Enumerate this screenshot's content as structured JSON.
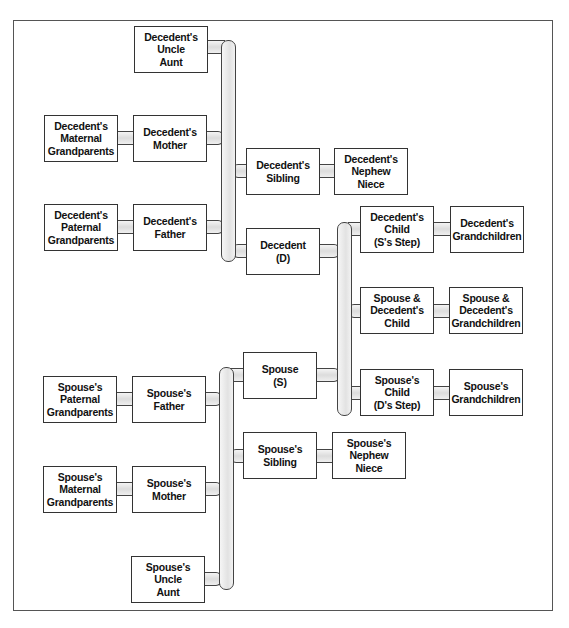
{
  "diagram": {
    "type": "family-tree",
    "colors": {
      "box_border": "#333333",
      "pipe_fill": "#e2e2e2",
      "background": "#ffffff"
    },
    "nodes": {
      "decedent_uncle_aunt": "Decedent's\nUncle\nAunt",
      "decedent_maternal_grandparents": "Decedent's\nMaternal\nGrandparents",
      "decedent_mother": "Decedent's\nMother",
      "decedent_sibling": "Decedent's\nSibling",
      "decedent_nephew_niece": "Decedent's\nNephew\nNiece",
      "decedent_paternal_grandparents": "Decedent's\nPaternal\nGrandparents",
      "decedent_father": "Decedent's\nFather",
      "decedent": "Decedent\n(D)",
      "decedent_child": "Decedent's\nChild\n(S's Step)",
      "decedent_grandchildren": "Decedent's\nGrandchildren",
      "joint_child": "Spouse &\nDecedent's\nChild",
      "joint_grandchildren": "Spouse &\nDecedent's\nGrandchildren",
      "spouse": "Spouse\n(S)",
      "spouse_child": "Spouse's\nChild\n(D's Step)",
      "spouse_grandchildren": "Spouse's\nGrandchildren",
      "spouse_paternal_grandparents": "Spouse's\nPaternal\nGrandparents",
      "spouse_father": "Spouse's\nFather",
      "spouse_sibling": "Spouse's\nSibling",
      "spouse_nephew_niece": "Spouse's\nNephew\nNiece",
      "spouse_maternal_grandparents": "Spouse's\nMaternal\nGrandparents",
      "spouse_mother": "Spouse's\nMother",
      "spouse_uncle_aunt": "Spouse's\nUncle\nAunt"
    },
    "edges": [
      [
        "decedent_maternal_grandparents",
        "decedent_mother"
      ],
      [
        "decedent_paternal_grandparents",
        "decedent_father"
      ],
      [
        "decedent_uncle_aunt",
        "decedent_parents_bus"
      ],
      [
        "decedent_mother",
        "decedent_parents_bus"
      ],
      [
        "decedent_father",
        "decedent_parents_bus"
      ],
      [
        "decedent_parents_bus",
        "decedent_sibling"
      ],
      [
        "decedent_parents_bus",
        "decedent"
      ],
      [
        "decedent_sibling",
        "decedent_nephew_niece"
      ],
      [
        "decedent",
        "children_bus"
      ],
      [
        "spouse",
        "children_bus"
      ],
      [
        "children_bus",
        "decedent_child"
      ],
      [
        "children_bus",
        "joint_child"
      ],
      [
        "children_bus",
        "spouse_child"
      ],
      [
        "decedent_child",
        "decedent_grandchildren"
      ],
      [
        "joint_child",
        "joint_grandchildren"
      ],
      [
        "spouse_child",
        "spouse_grandchildren"
      ],
      [
        "spouse_paternal_grandparents",
        "spouse_father"
      ],
      [
        "spouse_maternal_grandparents",
        "spouse_mother"
      ],
      [
        "spouse_father",
        "spouse_parents_bus"
      ],
      [
        "spouse_mother",
        "spouse_parents_bus"
      ],
      [
        "spouse_uncle_aunt",
        "spouse_parents_bus"
      ],
      [
        "spouse_parents_bus",
        "spouse"
      ],
      [
        "spouse_parents_bus",
        "spouse_sibling"
      ],
      [
        "spouse_sibling",
        "spouse_nephew_niece"
      ]
    ]
  }
}
